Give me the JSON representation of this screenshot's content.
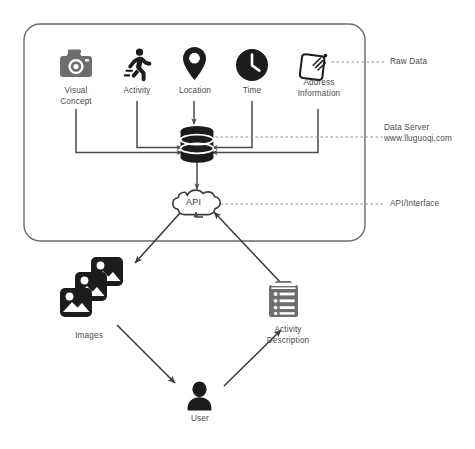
{
  "diagram": {
    "colors": {
      "icon_dark": "#1c1c1c",
      "icon_gray": "#6e6e6e",
      "line": "#4a4a4a",
      "border": "#6b6b6b",
      "text": "#4a4a4a",
      "background": "#ffffff"
    },
    "container": {
      "name": "raw-data-container"
    },
    "raw_data_sources": [
      {
        "id": "visual-concept",
        "label": "Visual\nConcept",
        "icon": "camera-icon"
      },
      {
        "id": "activity",
        "label": "Activity",
        "icon": "running-person-icon"
      },
      {
        "id": "location",
        "label": "Location",
        "icon": "map-pin-icon"
      },
      {
        "id": "time",
        "label": "Time",
        "icon": "clock-icon"
      },
      {
        "id": "address-information",
        "label": "Address\nInformation",
        "icon": "tag-icon"
      }
    ],
    "server": {
      "id": "data-server",
      "icon": "database-cylinder-icon"
    },
    "api": {
      "id": "api-node",
      "label": "API",
      "icon": "cloud-icon"
    },
    "annotations": [
      {
        "id": "raw-data-annotation",
        "label": "Raw Data"
      },
      {
        "id": "data-server-annotation",
        "label": "Data Server\nwww.lluguoqi.com"
      },
      {
        "id": "api-interface-annotation",
        "label": "API/Interface"
      }
    ],
    "outputs": [
      {
        "id": "images",
        "label": "Images",
        "icon": "image-stack-icon"
      },
      {
        "id": "activity-description",
        "label": "Activity\nDescription",
        "icon": "clipboard-list-icon"
      },
      {
        "id": "user",
        "label": "User",
        "icon": "user-person-icon"
      }
    ]
  }
}
